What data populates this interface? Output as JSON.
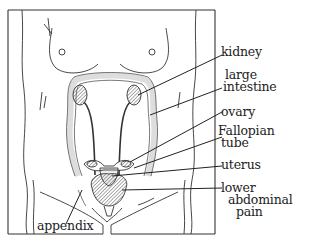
{
  "diagram": {
    "labels": {
      "kidney": "kidney",
      "large_intestine_1": "large",
      "large_intestine_2": "intestine",
      "ovary": "ovary",
      "fallopian_1": "Fallopian",
      "fallopian_2": "tube",
      "uterus": "uterus",
      "pain_1": "lower",
      "pain_2": "abdominal",
      "pain_3": "pain",
      "appendix": "appendix"
    },
    "colors": {
      "line": "#222222",
      "hatch": "#555555",
      "background": "#ffffff"
    }
  }
}
